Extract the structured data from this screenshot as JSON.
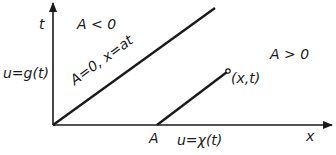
{
  "diagram": {
    "axes": {
      "x_label": "x",
      "t_label": "t"
    },
    "regions": {
      "upper": "A < 0",
      "lower": "A > 0"
    },
    "boundary_conditions": {
      "left": "u=g(t)",
      "bottom": "u=χ(t)"
    },
    "characteristic_line": "A=0, x=at",
    "point_A": "A",
    "point_xt": "(x,t)",
    "colors": {
      "ink": "#1a1a1a",
      "background": "#ffffff"
    }
  }
}
